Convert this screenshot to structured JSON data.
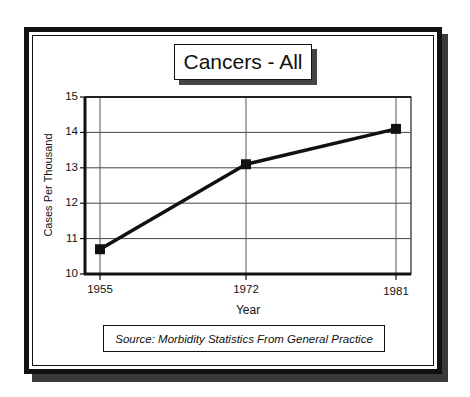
{
  "title": "Cancers - All",
  "source": "Source: Morbidity Statistics From General Practice",
  "chart_data": {
    "type": "line",
    "title": "Cancers - All",
    "xlabel": "Year",
    "ylabel": "Cases Per Thousand",
    "categories": [
      "1955",
      "1972",
      "1981"
    ],
    "x": [
      1955,
      1972,
      1981
    ],
    "series": [
      {
        "name": "Cancers - All",
        "values": [
          10.7,
          13.1,
          14.1
        ]
      }
    ],
    "ylim": [
      10,
      15
    ],
    "yticks": [
      "10",
      "11",
      "12",
      "13",
      "14",
      "15"
    ],
    "xticks": [
      "1955",
      "1972",
      "1981"
    ],
    "grid": true,
    "legend": null,
    "annotation": "Source: Morbidity Statistics From General Practice"
  }
}
